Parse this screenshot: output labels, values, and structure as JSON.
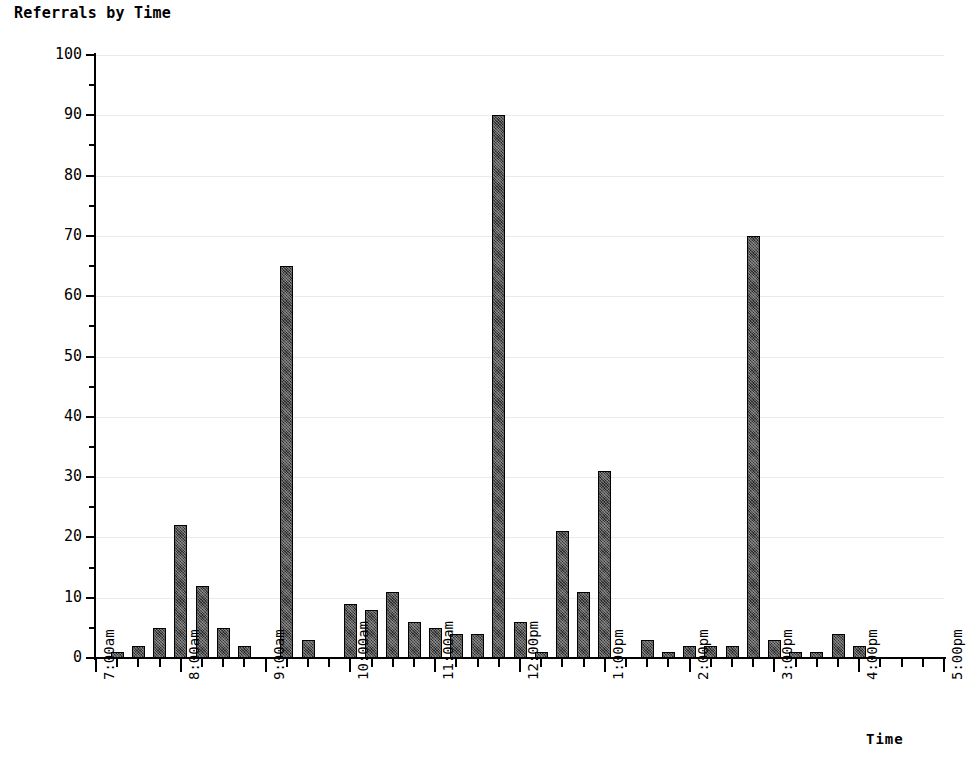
{
  "chart_data": {
    "type": "bar",
    "title": "Referrals by Time",
    "xlabel": "Time",
    "ylabel": "Number of Referrals",
    "ylim": [
      0,
      100
    ],
    "y_major_step": 10,
    "y_minor_step": 5,
    "grid": true,
    "legend": null,
    "x_axis_start": "7:00am",
    "x_axis_end": "5:00pm",
    "x_tick_interval_minutes": 15,
    "y_tick_labels": [
      "0",
      "10",
      "20",
      "30",
      "40",
      "50",
      "60",
      "70",
      "80",
      "90",
      "100"
    ],
    "x_tick_labels": [
      "7:00am",
      "8:00am",
      "9:00am",
      "10:00am",
      "11:00am",
      "12:00pm",
      "1:00pm",
      "2:00pm",
      "3:00pm",
      "4:00pm",
      "5:00pm"
    ],
    "categories": [
      "7:00am",
      "7:15am",
      "7:30am",
      "7:45am",
      "8:00am",
      "8:15am",
      "8:30am",
      "8:45am",
      "9:00am",
      "9:15am",
      "9:30am",
      "9:45am",
      "10:00am",
      "10:15am",
      "10:30am",
      "10:45am",
      "11:00am",
      "11:15am",
      "11:30am",
      "11:45am",
      "12:00pm",
      "12:15pm",
      "12:30pm",
      "12:45pm",
      "1:00pm",
      "1:15pm",
      "1:30pm",
      "1:45pm",
      "2:00pm",
      "2:15pm",
      "2:30pm",
      "2:45pm",
      "3:00pm",
      "3:15pm",
      "3:30pm",
      "3:45pm",
      "4:00pm",
      "4:15pm",
      "4:30pm",
      "4:45pm",
      "5:00pm"
    ],
    "values": [
      0,
      1,
      2,
      5,
      22,
      12,
      5,
      2,
      0,
      65,
      3,
      0,
      9,
      8,
      11,
      6,
      5,
      4,
      4,
      90,
      6,
      1,
      21,
      11,
      31,
      0,
      3,
      1,
      2,
      2,
      2,
      70,
      3,
      1,
      1,
      4,
      2,
      0,
      0,
      0,
      0
    ]
  },
  "bottom_caption": "",
  "colors": {
    "bar_fill": "#2b2b2b",
    "axis": "#000000",
    "gridline": "#e9e9ef",
    "background": "#ffffff"
  }
}
